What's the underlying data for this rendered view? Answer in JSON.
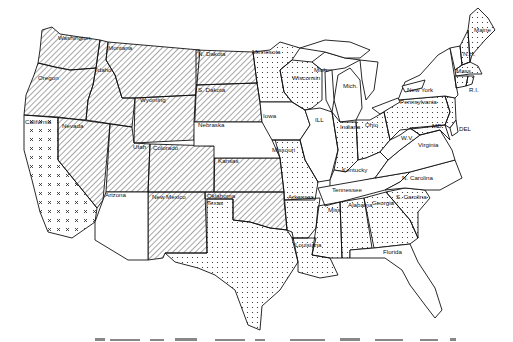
{
  "map": {
    "title": "",
    "type": "choropleth-pattern",
    "region": "Contiguous United States",
    "patterns": {
      "hatched": "diagonal-hatch",
      "dotted": "dot-stipple",
      "crossed": "x-marks",
      "blank": "no-fill"
    },
    "colors": {
      "ink": "#111111",
      "background": "#ffffff"
    },
    "labels": {
      "washington": "Washington",
      "oregon": "Oregon",
      "idaho": "Idaho",
      "montana": "Montana",
      "wyoming": "Wyoming",
      "california": "California",
      "nevada": "Nevada",
      "utah": "Utah",
      "colorado": "Colorado",
      "arizona": "Arizona",
      "new_mexico": "New Mexico",
      "n_dakota": "N. Dakota",
      "s_dakota": "S. Dakota",
      "nebraska": "Nebraska",
      "kansas": "Kansas",
      "oklahoma": "Oklahoma",
      "texas": "Texas",
      "minnesota": "Minnesota",
      "iowa": "Iowa",
      "missouri": "Missouri",
      "arkansas": "Arkansas",
      "louisiana": "Louisiana",
      "wisconsin": "Wisconsin",
      "ill": "ILL",
      "mich_up": "Mich.",
      "mich": "Mich.",
      "indiana": "Indiana",
      "ohio": "Ohio",
      "kentucky": "Kentucky",
      "tennessee": "Tennessee",
      "miss": "Miss.",
      "alabama": "Alabama",
      "georgia": "Georgia",
      "florida": "Florida",
      "s_carolina": "S. Carolina",
      "n_carolina": "N. Carolina",
      "virginia": "Virginia",
      "wv": "W.V.",
      "pennsylvania": "Pennsylvania",
      "new_york": "New York",
      "md": "MD",
      "del": "DEL",
      "nj": "N.J.",
      "vt": "VT",
      "nh": "N.H.",
      "maine": "Maine",
      "mass": "Mass.",
      "conn": "Conn.",
      "ri": "R.I."
    },
    "state_patterns": {
      "hatched": [
        "Washington",
        "Oregon",
        "Idaho",
        "Montana",
        "Wyoming",
        "Nevada",
        "Utah",
        "Colorado",
        "N. Dakota",
        "S. Dakota",
        "New Mexico",
        "Kansas",
        "Oklahoma"
      ],
      "crossed": [
        "California"
      ],
      "dotted": [
        "Minnesota",
        "Wisconsin",
        "Missouri",
        "Arkansas",
        "Louisiana",
        "Texas",
        "Mississippi",
        "Alabama",
        "Georgia",
        "S. Carolina",
        "Indiana",
        "Ohio",
        "Pennsylvania",
        "Maryland",
        "New Jersey",
        "Maine",
        "New Hampshire",
        "Massachusetts",
        "Connecticut",
        "Rhode Island"
      ],
      "blank": [
        "Arizona",
        "Nebraska",
        "Iowa",
        "Illinois",
        "Michigan",
        "Kentucky",
        "Tennessee",
        "Virginia",
        "W.V.",
        "N. Carolina",
        "Florida",
        "New York",
        "Vermont",
        "Delaware"
      ]
    }
  },
  "caption": {
    "text": ""
  }
}
